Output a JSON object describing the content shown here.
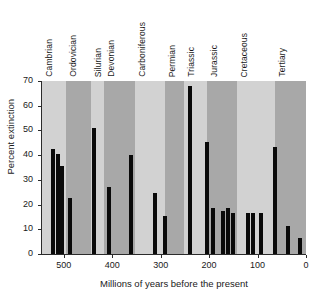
{
  "chart_data": {
    "type": "bar",
    "title": "",
    "subtitle": "",
    "xlabel": "Millions of years before the present",
    "ylabel": "Percent extinction",
    "xlim": [
      545,
      0
    ],
    "ylim": [
      0,
      70
    ],
    "x_reversed": true,
    "grid": false,
    "legend_position": "none",
    "xticks": [
      500,
      400,
      300,
      200,
      100,
      0
    ],
    "xtick_labels": [
      "500",
      "400",
      "300",
      "200",
      "100",
      "0"
    ],
    "yticks": [
      0,
      10,
      20,
      30,
      40,
      50,
      60,
      70
    ],
    "ytick_labels": [
      "0",
      "10",
      "20",
      "30",
      "40",
      "50",
      "60",
      "70"
    ],
    "bar_color": "#0a0a0a",
    "band_color_light": "#d2d2d2",
    "band_color_dark": "#a8a8a8",
    "x_unit": "Ma",
    "y_unit": "percent",
    "period_bands": [
      {
        "label": "Cambrian",
        "start": 545,
        "end": 495,
        "shade": "light"
      },
      {
        "label": "Ordovician",
        "start": 495,
        "end": 443,
        "shade": "dark"
      },
      {
        "label": "Silurian",
        "start": 443,
        "end": 417,
        "shade": "light"
      },
      {
        "label": "Devonian",
        "start": 417,
        "end": 354,
        "shade": "dark"
      },
      {
        "label": "Carboniferous",
        "start": 354,
        "end": 292,
        "shade": "light"
      },
      {
        "label": "Permian",
        "start": 292,
        "end": 251,
        "shade": "dark"
      },
      {
        "label": "Triassic",
        "start": 251,
        "end": 205,
        "shade": "light"
      },
      {
        "label": "Jurassic",
        "start": 205,
        "end": 142,
        "shade": "dark"
      },
      {
        "label": "Cretaceous",
        "start": 142,
        "end": 65,
        "shade": "light"
      },
      {
        "label": "Tertiary",
        "start": 65,
        "end": 0,
        "shade": "dark"
      }
    ],
    "x": [
      522,
      512,
      503,
      487,
      437,
      407,
      362,
      311,
      291,
      240,
      205,
      192,
      171,
      160,
      150,
      119,
      109,
      92,
      65,
      37,
      13
    ],
    "values": [
      42.5,
      40.5,
      35.5,
      22.5,
      51.0,
      27.0,
      40.0,
      24.5,
      15.5,
      68.0,
      45.5,
      18.5,
      17.5,
      18.5,
      16.5,
      16.5,
      16.5,
      16.5,
      43.5,
      11.5,
      6.5
    ],
    "bars": [
      {
        "age": 522,
        "percent": 42.5,
        "period": "Cambrian"
      },
      {
        "age": 512,
        "percent": 40.5,
        "period": "Cambrian"
      },
      {
        "age": 503,
        "percent": 35.5,
        "period": "Cambrian"
      },
      {
        "age": 487,
        "percent": 22.5,
        "period": "Ordovician"
      },
      {
        "age": 437,
        "percent": 51.0,
        "period": "Silurian"
      },
      {
        "age": 407,
        "percent": 27.0,
        "period": "Devonian"
      },
      {
        "age": 362,
        "percent": 40.0,
        "period": "Devonian"
      },
      {
        "age": 311,
        "percent": 24.5,
        "period": "Carboniferous"
      },
      {
        "age": 291,
        "percent": 15.5,
        "period": "Carboniferous"
      },
      {
        "age": 240,
        "percent": 68.0,
        "period": "Triassic"
      },
      {
        "age": 205,
        "percent": 45.5,
        "period": "Triassic"
      },
      {
        "age": 192,
        "percent": 18.5,
        "period": "Jurassic"
      },
      {
        "age": 171,
        "percent": 17.5,
        "period": "Jurassic"
      },
      {
        "age": 160,
        "percent": 18.5,
        "period": "Jurassic"
      },
      {
        "age": 150,
        "percent": 16.5,
        "period": "Jurassic"
      },
      {
        "age": 119,
        "percent": 16.5,
        "period": "Cretaceous"
      },
      {
        "age": 109,
        "percent": 16.5,
        "period": "Cretaceous"
      },
      {
        "age": 92,
        "percent": 16.5,
        "period": "Cretaceous"
      },
      {
        "age": 65,
        "percent": 43.5,
        "period": "Cretaceous"
      },
      {
        "age": 37,
        "percent": 11.5,
        "period": "Tertiary"
      },
      {
        "age": 13,
        "percent": 6.5,
        "period": "Tertiary"
      }
    ]
  }
}
